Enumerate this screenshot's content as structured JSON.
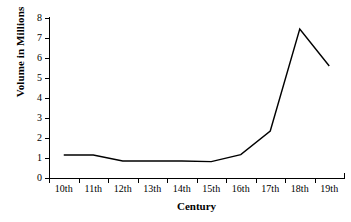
{
  "chart_data": {
    "type": "line",
    "title": "",
    "xlabel": "Century",
    "ylabel": "Volume in Millions",
    "categories": [
      "10th",
      "11th",
      "12th",
      "13th",
      "14th",
      "15th",
      "16th",
      "17th",
      "18th",
      "19th"
    ],
    "values": [
      1.15,
      1.15,
      0.85,
      0.85,
      0.85,
      0.82,
      1.17,
      2.35,
      7.45,
      5.6
    ],
    "series": [
      {
        "name": "Volume in Millions",
        "values": [
          1.15,
          1.15,
          0.85,
          0.85,
          0.85,
          0.82,
          1.17,
          2.35,
          7.45,
          5.6
        ],
        "color": "#000000"
      }
    ],
    "ylim": [
      0,
      8
    ],
    "ytick_labels": [
      "0",
      "1",
      "2",
      "3",
      "4",
      "5",
      "6",
      "7",
      "8"
    ],
    "ytick_values": [
      0,
      1,
      2,
      3,
      4,
      5,
      6,
      7,
      8
    ],
    "grid": false,
    "legend": "none",
    "line_color": "#000000",
    "background_color": "#ffffff"
  }
}
